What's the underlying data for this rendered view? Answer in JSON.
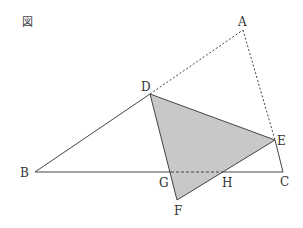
{
  "figure": {
    "title": "図",
    "colors": {
      "line": "#444444",
      "fill": "#c8c8c8",
      "text": "#333333"
    },
    "points": {
      "A": {
        "label": "A",
        "x": 243,
        "y": 30
      },
      "B": {
        "label": "B",
        "x": 35,
        "y": 172
      },
      "C": {
        "label": "C",
        "x": 283,
        "y": 172
      },
      "D": {
        "label": "D",
        "x": 150,
        "y": 94
      },
      "E": {
        "label": "E",
        "x": 275,
        "y": 140
      },
      "F": {
        "label": "F",
        "x": 177,
        "y": 200
      },
      "G": {
        "label": "G",
        "x": 171,
        "y": 172
      },
      "H": {
        "label": "H",
        "x": 221,
        "y": 172
      }
    }
  }
}
